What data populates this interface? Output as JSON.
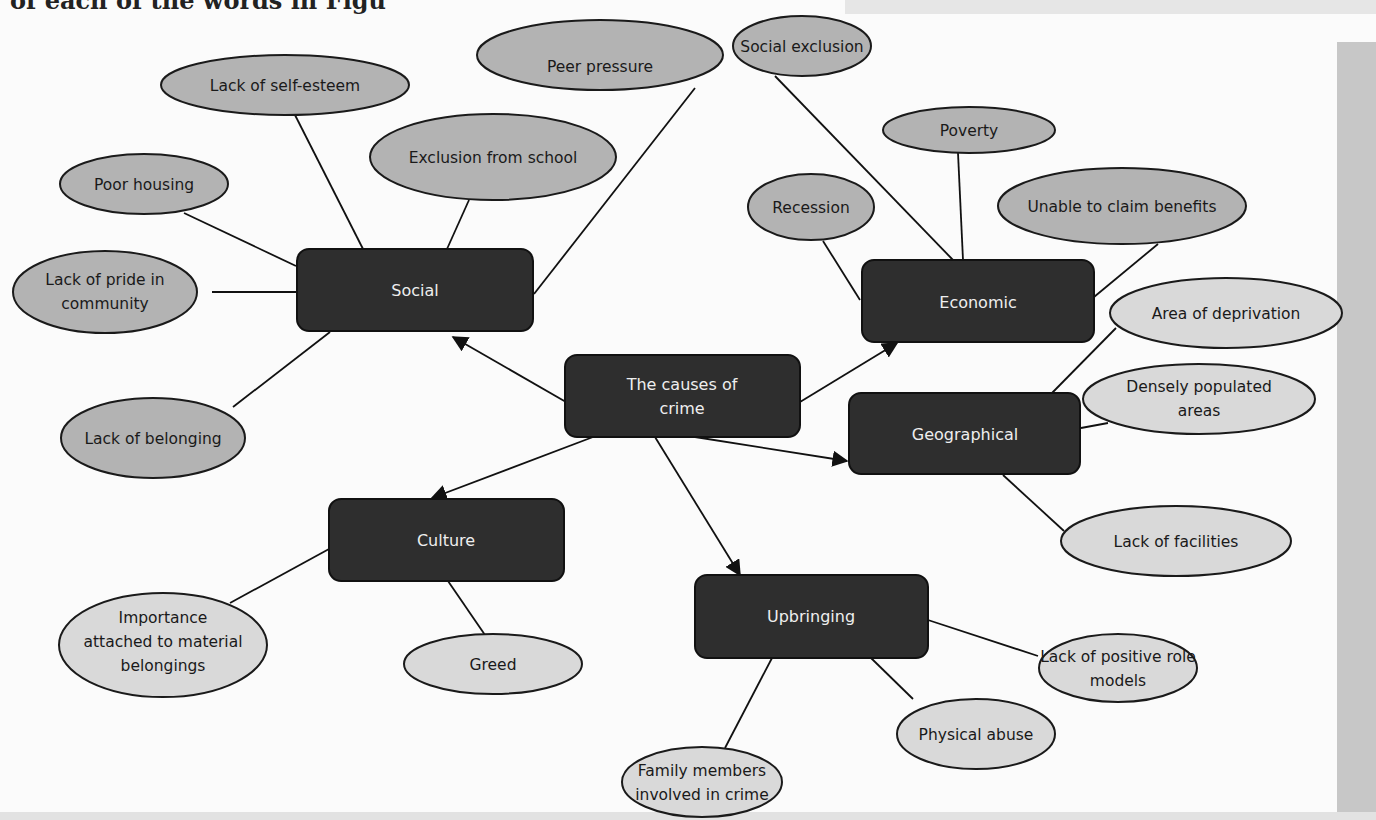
{
  "page": {
    "top_text_fragment": "of each of the words in Figu"
  },
  "colors": {
    "central_box": "#2e2e2e",
    "category_box": "#2e2e2e",
    "ellipse_dark": "#b3b3b3",
    "ellipse_light": "#d9d9d9",
    "line": "#111111",
    "side_band": "#c7c7c7"
  },
  "diagram": {
    "center": {
      "label_line1": "The causes of",
      "label_line2": "crime"
    },
    "categories": {
      "social": {
        "label": "Social",
        "causes": {
          "self_esteem": "Lack of self-esteem",
          "peer_pressure": "Peer pressure",
          "exclusion_school": "Exclusion from school",
          "poor_housing": "Poor housing",
          "pride_line1": "Lack of pride in",
          "pride_line2": "community",
          "belonging": "Lack of belonging"
        }
      },
      "economic": {
        "label": "Economic",
        "causes": {
          "social_exclusion": "Social exclusion",
          "poverty": "Poverty",
          "recession": "Recession",
          "benefits": "Unable to claim benefits"
        }
      },
      "geographical": {
        "label": "Geographical",
        "causes": {
          "deprivation": "Area of deprivation",
          "dense_line1": "Densely populated",
          "dense_line2": "areas",
          "facilities": "Lack of facilities"
        }
      },
      "culture": {
        "label": "Culture",
        "causes": {
          "importance_line1": "Importance",
          "importance_line2": "attached to material",
          "importance_line3": "belongings",
          "greed": "Greed"
        }
      },
      "upbringing": {
        "label": "Upbringing",
        "causes": {
          "role_models_line1": "Lack of positive role",
          "role_models_line2": "models",
          "physical_abuse": "Physical abuse",
          "family_line1": "Family members",
          "family_line2": "involved in crime"
        }
      }
    }
  }
}
